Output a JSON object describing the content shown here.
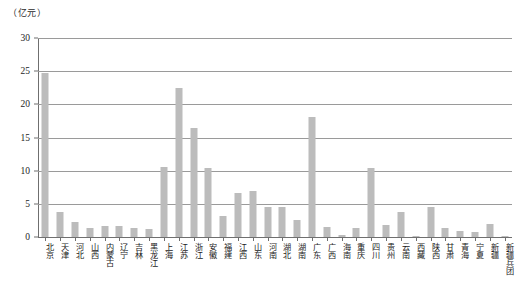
{
  "unit_label": "（亿元）",
  "chart_data": {
    "type": "bar",
    "title": "",
    "subtitle": "",
    "xlabel": "",
    "ylabel": "（亿元）",
    "ylim": [
      0,
      30
    ],
    "yticks": [
      0,
      5,
      10,
      15,
      20,
      25,
      30
    ],
    "grid": true,
    "legend": "none",
    "bar_color": "#bcbcbc",
    "axis_color": "#6f6f6f",
    "categories": [
      "北京",
      "天津",
      "河北",
      "山西",
      "内蒙古",
      "辽宁",
      "吉林",
      "黑龙江",
      "上海",
      "江苏",
      "浙江",
      "安徽",
      "福建",
      "江西",
      "山东",
      "河南",
      "湖北",
      "湖南",
      "广东",
      "广西",
      "海南",
      "重庆",
      "四川",
      "贵州",
      "云南",
      "西藏",
      "陕西",
      "甘肃",
      "青海",
      "宁夏",
      "新疆",
      "新疆兵团"
    ],
    "values": [
      24.7,
      3.7,
      2.3,
      1.3,
      1.7,
      1.6,
      1.3,
      1.2,
      10.5,
      22.4,
      16.5,
      10.4,
      3.2,
      6.6,
      7.0,
      4.6,
      4.6,
      2.6,
      18.1,
      1.5,
      0.3,
      1.3,
      10.4,
      1.8,
      3.7,
      0.2,
      4.5,
      1.4,
      0.9,
      0.7,
      2.0,
      0.1
    ]
  }
}
